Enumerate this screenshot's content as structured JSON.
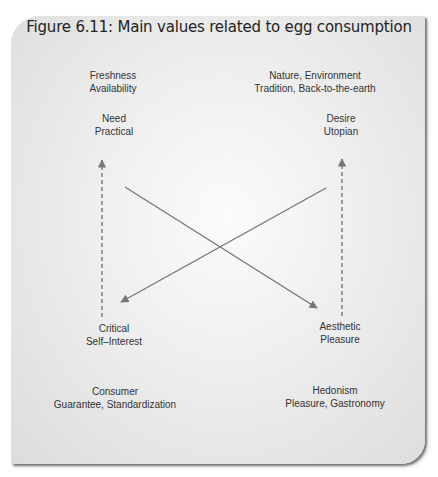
{
  "figure": {
    "title": "Figure 6.11: Main values related to egg consumption"
  },
  "quadrants": {
    "top_left": {
      "values": [
        "Freshness",
        "Availability"
      ],
      "axis_label": [
        "Need",
        "Practical"
      ]
    },
    "top_right": {
      "values": [
        "Nature, Environment",
        "Tradition, Back-to-the-earth"
      ],
      "axis_label": [
        "Desire",
        "Utopian"
      ]
    },
    "bottom_left": {
      "axis_label": [
        "Critical",
        "Self–Interest"
      ],
      "values": [
        "Consumer",
        "Guarantee, Standardization"
      ]
    },
    "bottom_right": {
      "axis_label": [
        "Aesthetic",
        "Pleasure"
      ],
      "values": [
        "Hedonism",
        "Pleasure, Gastronomy"
      ]
    }
  },
  "arrows": [
    {
      "style": "dashed",
      "from": "Critical / Self–Interest",
      "to": "Need / Practical"
    },
    {
      "style": "dashed",
      "from": "Aesthetic / Pleasure",
      "to": "Desire / Utopian"
    },
    {
      "style": "solid",
      "from": "Need / Practical",
      "to": "Aesthetic / Pleasure"
    },
    {
      "style": "solid",
      "from": "Desire / Utopian",
      "to": "Critical / Self–Interest"
    }
  ],
  "colors": {
    "card_bg": "#e4e4e4",
    "arrow": "#777777",
    "text": "#333333",
    "title": "#232323"
  }
}
